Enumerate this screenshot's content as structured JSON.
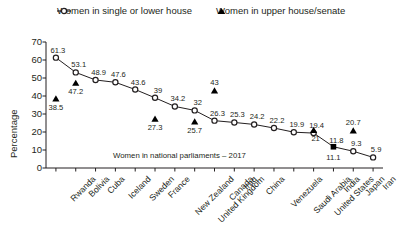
{
  "legend": {
    "items": [
      {
        "label": "Women in single or lower house",
        "marker": "open-circle-line-icon"
      },
      {
        "label": "Women in upper house/senate",
        "marker": "filled-triangle-icon"
      }
    ]
  },
  "annotation": "Women in national parliaments – 2017",
  "chart_data": {
    "type": "line",
    "title": "",
    "xlabel": "",
    "ylabel": "Percentage",
    "ylim": [
      0,
      70
    ],
    "yticks": [
      0,
      10,
      20,
      30,
      40,
      50,
      60,
      70
    ],
    "grid": false,
    "legend_position": "top",
    "categories": [
      "Rwanda",
      "Bolivia",
      "Cuba",
      "Iceland",
      "Sweden",
      "France",
      "New Zealand",
      "United Kingdom",
      "Canada",
      "Iraq",
      "China",
      "Venezuela",
      "Saudi Arabia",
      "United States",
      "India",
      "Japan",
      "Iran"
    ],
    "series": [
      {
        "name": "Women in single or lower house",
        "marker": "open-circle",
        "values": [
          61.3,
          53.1,
          48.9,
          47.6,
          43.6,
          39,
          34.2,
          32,
          26.3,
          25.3,
          24.2,
          22.2,
          19.9,
          19.4,
          11.8,
          9.3,
          5.9
        ]
      },
      {
        "name": "Women in upper house/senate",
        "marker": "filled-triangle",
        "values": [
          38.5,
          47.2,
          null,
          null,
          null,
          27.3,
          null,
          25.7,
          43,
          null,
          null,
          null,
          null,
          21,
          11.1,
          20.7,
          null
        ]
      }
    ]
  },
  "colors": {
    "line": "#231f20",
    "marker": "#231f20",
    "triangle": "#000000",
    "text": "#231f20",
    "background": "#ffffff"
  }
}
